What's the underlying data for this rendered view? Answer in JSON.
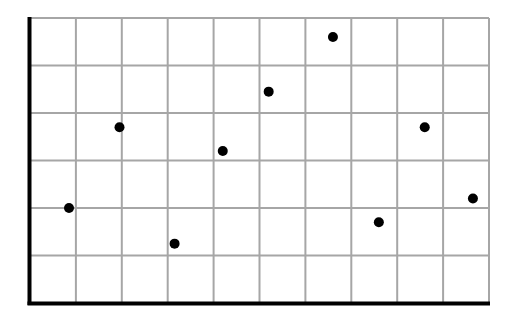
{
  "chart_data": {
    "type": "scatter",
    "title": "",
    "xlabel": "",
    "ylabel": "",
    "xlim": [
      0,
      10
    ],
    "ylim": [
      0,
      6
    ],
    "grid": true,
    "legend": null,
    "x_ticks": [
      0,
      1,
      2,
      3,
      4,
      5,
      6,
      7,
      8,
      9,
      10
    ],
    "y_ticks": [
      0,
      1,
      2,
      3,
      4,
      5,
      6
    ],
    "tick_labels_visible": false,
    "series": [
      {
        "name": "points",
        "marker": "circle",
        "color": "#000000",
        "points": [
          {
            "x": 0.85,
            "y": 2.0
          },
          {
            "x": 1.95,
            "y": 3.7
          },
          {
            "x": 3.15,
            "y": 1.25
          },
          {
            "x": 4.2,
            "y": 3.2
          },
          {
            "x": 5.2,
            "y": 4.45
          },
          {
            "x": 6.6,
            "y": 5.6
          },
          {
            "x": 7.6,
            "y": 1.7
          },
          {
            "x": 8.6,
            "y": 3.7
          },
          {
            "x": 9.65,
            "y": 2.2
          }
        ]
      }
    ]
  },
  "style": {
    "background": "#ffffff",
    "grid_color": "#a6a6a6",
    "axis_color": "#000000",
    "point_color": "#000000"
  },
  "layout": {
    "plot_left": 30,
    "plot_right": 489,
    "plot_top": 18,
    "plot_bottom": 303,
    "point_radius": 5
  }
}
